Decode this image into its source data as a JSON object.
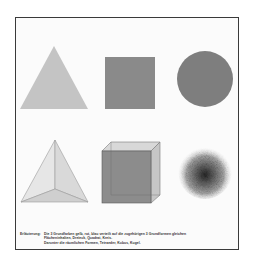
{
  "figure": {
    "top_row": [
      {
        "shape": "triangle",
        "name": "Dreieck",
        "color": "#c2c2c2"
      },
      {
        "shape": "square",
        "name": "Quadrat",
        "color": "#8a8a8a"
      },
      {
        "shape": "circle",
        "name": "Kreis",
        "color": "#7d7d7d"
      }
    ],
    "bottom_row": [
      {
        "shape": "tetrahedron",
        "name": "Tetraeder"
      },
      {
        "shape": "cube",
        "name": "Kubus"
      },
      {
        "shape": "sphere",
        "name": "Kugel"
      }
    ]
  },
  "caption": {
    "label": "Erläuterung:",
    "line1": "Die 3 Grundfarben gelb, rot, blau verteilt auf die zugehörigen 3 Grundformen gleichen",
    "line2": "Flächeninhalten, Dreieck, Quadrat, Kreis.",
    "line3": "Darunter die räumlichen Formen, Tetraeder, Kubus, Kugel."
  }
}
